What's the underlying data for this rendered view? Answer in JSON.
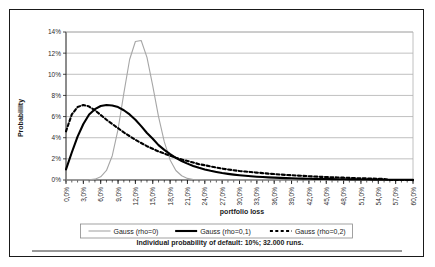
{
  "chart_data": {
    "type": "line",
    "title": "",
    "xlabel": "portfolio loss",
    "ylabel": "Probabililty",
    "caption": "Individual probability of default: 10%; 32.000 runs.",
    "grid": true,
    "legend_position": "bottom",
    "xlim": [
      0,
      60
    ],
    "ylim": [
      0,
      14
    ],
    "xticks": [
      "0,0%",
      "3,0%",
      "6,0%",
      "9,0%",
      "12,0%",
      "15,0%",
      "18,0%",
      "21,0%",
      "24,0%",
      "27,0%",
      "30,0%",
      "33,0%",
      "36,0%",
      "39,0%",
      "42,0%",
      "45,0%",
      "48,0%",
      "51,0%",
      "54,0%",
      "57,0%",
      "60,0%"
    ],
    "xtick_values": [
      0,
      3,
      6,
      9,
      12,
      15,
      18,
      21,
      24,
      27,
      30,
      33,
      36,
      39,
      42,
      45,
      48,
      51,
      54,
      57,
      60
    ],
    "yticks": [
      "0%",
      "2%",
      "4%",
      "6%",
      "8%",
      "10%",
      "12%",
      "14%"
    ],
    "ytick_values": [
      0,
      2,
      4,
      6,
      8,
      10,
      12,
      14
    ],
    "minor_tick_step": 1,
    "x": [
      0,
      1,
      2,
      3,
      4,
      5,
      6,
      7,
      8,
      9,
      10,
      11,
      12,
      13,
      14,
      15,
      16,
      17,
      18,
      19,
      20,
      21,
      22,
      23,
      24,
      25,
      26,
      27,
      28,
      29,
      30,
      31,
      32,
      33,
      34,
      35,
      36,
      37,
      38,
      39,
      40,
      41,
      42,
      43,
      44,
      45,
      46,
      47,
      48,
      49,
      50,
      51,
      52,
      53,
      54,
      55,
      56,
      57,
      58,
      59,
      60
    ],
    "series": [
      {
        "name": "Gauss (rho=0)",
        "color": "#a6a6a6",
        "width": 1.1,
        "dash": "none",
        "values": [
          0.0,
          0.0,
          0.0,
          0.0,
          0.02,
          0.08,
          0.3,
          0.9,
          2.3,
          4.8,
          8.2,
          11.4,
          13.1,
          13.2,
          11.6,
          8.9,
          6.0,
          3.6,
          1.9,
          0.9,
          0.4,
          0.15,
          0.05,
          0.02,
          0.0,
          0.0,
          0.0,
          0.0,
          0.0,
          0.0,
          0.0,
          0.0,
          0.0,
          0.0,
          0.0,
          0.0,
          0.0,
          0.0,
          0.0,
          0.0,
          0.0,
          0.0,
          0.0,
          0.0,
          0.0,
          0.0,
          0.0,
          0.0,
          0.0,
          0.0,
          0.0,
          0.0,
          0.0,
          0.0,
          0.0,
          0.0,
          0.0,
          0.0,
          0.0,
          0.0,
          0.0
        ]
      },
      {
        "name": "Gauss (rho=0,1)",
        "color": "#000000",
        "width": 2.1,
        "dash": "none",
        "values": [
          1.0,
          2.6,
          4.1,
          5.3,
          6.2,
          6.7,
          7.0,
          7.1,
          7.05,
          6.9,
          6.6,
          6.2,
          5.7,
          5.1,
          4.45,
          3.9,
          3.3,
          2.85,
          2.45,
          2.1,
          1.8,
          1.55,
          1.33,
          1.15,
          1.0,
          0.87,
          0.76,
          0.66,
          0.58,
          0.51,
          0.45,
          0.4,
          0.35,
          0.31,
          0.28,
          0.25,
          0.22,
          0.2,
          0.18,
          0.16,
          0.14,
          0.13,
          0.12,
          0.11,
          0.1,
          0.09,
          0.08,
          0.07,
          0.065,
          0.06,
          0.055,
          0.05,
          0.045,
          0.04,
          0.035,
          0.03,
          0.028,
          0.025,
          0.02,
          0.018,
          0.015
        ]
      },
      {
        "name": "Gauss (rho=0,2)",
        "color": "#000000",
        "width": 2.1,
        "dash": "3,2.4",
        "values": [
          4.6,
          6.2,
          6.9,
          7.1,
          6.95,
          6.6,
          6.15,
          5.7,
          5.3,
          4.9,
          4.5,
          4.15,
          3.8,
          3.5,
          3.2,
          2.95,
          2.7,
          2.5,
          2.3,
          2.1,
          1.95,
          1.8,
          1.65,
          1.5,
          1.4,
          1.28,
          1.18,
          1.08,
          1.0,
          0.92,
          0.85,
          0.8,
          0.75,
          0.7,
          0.65,
          0.6,
          0.56,
          0.52,
          0.48,
          0.45,
          0.42,
          0.39,
          0.36,
          0.33,
          0.3,
          0.28,
          0.26,
          0.24,
          0.22,
          0.2,
          0.18,
          0.16,
          0.15,
          0.13,
          0.12,
          0.1,
          0.0,
          0.0,
          0.0,
          0.0,
          0.0
        ]
      }
    ]
  }
}
